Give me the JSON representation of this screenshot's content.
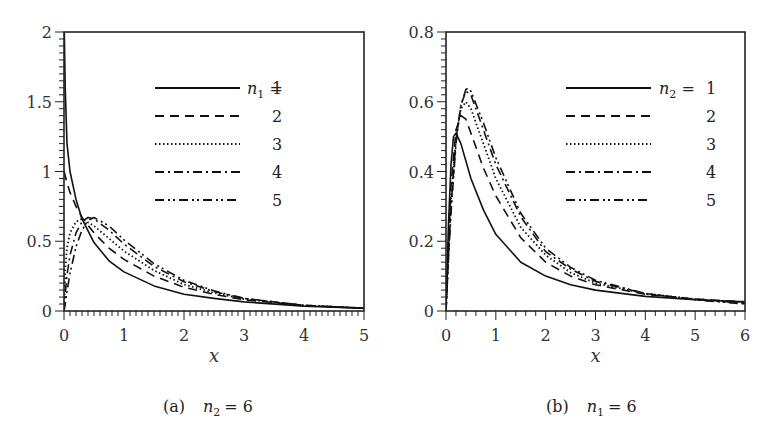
{
  "chart_data": [
    {
      "type": "line",
      "panel": "a",
      "caption": "(a)",
      "caption_param": "n",
      "caption_sub": "2",
      "caption_value": "= 6",
      "xlabel": "x",
      "ylabel": "",
      "xlim": [
        0,
        5
      ],
      "ylim": [
        0,
        2
      ],
      "xticks": [
        "0",
        "1",
        "2",
        "3",
        "4",
        "5"
      ],
      "yticks": [
        "0",
        "0.5",
        "1",
        "1.5",
        "2"
      ],
      "grid": false,
      "legend_position": "upper right",
      "legend_title_var": "n",
      "legend_title_sub": "1",
      "series": [
        {
          "name": "1",
          "style": "solid",
          "x": [
            0.005,
            0.02,
            0.05,
            0.1,
            0.2,
            0.3,
            0.5,
            0.75,
            1.0,
            1.5,
            2.0,
            2.5,
            3.0,
            4.0,
            5.0
          ],
          "y": [
            2.0,
            1.6,
            1.2,
            1.0,
            0.8,
            0.66,
            0.49,
            0.36,
            0.28,
            0.18,
            0.12,
            0.09,
            0.065,
            0.035,
            0.02
          ]
        },
        {
          "name": "2",
          "style": "dashed",
          "x": [
            0.0,
            0.02,
            0.05,
            0.1,
            0.2,
            0.3,
            0.5,
            0.75,
            1.0,
            1.5,
            2.0,
            2.5,
            3.0,
            4.0,
            5.0
          ],
          "y": [
            1.0,
            0.97,
            0.92,
            0.85,
            0.75,
            0.67,
            0.56,
            0.45,
            0.37,
            0.25,
            0.17,
            0.12,
            0.08,
            0.04,
            0.02
          ]
        },
        {
          "name": "3",
          "style": "dotted",
          "x": [
            0.0,
            0.02,
            0.05,
            0.1,
            0.2,
            0.3,
            0.5,
            0.75,
            1.0,
            1.5,
            2.0,
            2.5,
            3.0,
            4.0,
            5.0
          ],
          "y": [
            0.0,
            0.3,
            0.45,
            0.56,
            0.64,
            0.66,
            0.61,
            0.52,
            0.43,
            0.29,
            0.19,
            0.13,
            0.085,
            0.04,
            0.02
          ]
        },
        {
          "name": "4",
          "style": "dashdot",
          "x": [
            0.0,
            0.02,
            0.05,
            0.1,
            0.2,
            0.3,
            0.4,
            0.5,
            0.75,
            1.0,
            1.5,
            2.0,
            2.5,
            3.0,
            4.0,
            5.0
          ],
          "y": [
            0.0,
            0.12,
            0.26,
            0.4,
            0.56,
            0.64,
            0.67,
            0.66,
            0.58,
            0.48,
            0.32,
            0.21,
            0.14,
            0.09,
            0.04,
            0.02
          ]
        },
        {
          "name": "5",
          "style": "dashdotdot",
          "x": [
            0.0,
            0.02,
            0.05,
            0.1,
            0.2,
            0.3,
            0.4,
            0.5,
            0.75,
            1.0,
            1.5,
            2.0,
            2.5,
            3.0,
            4.0,
            5.0
          ],
          "y": [
            0.0,
            0.05,
            0.14,
            0.27,
            0.46,
            0.58,
            0.65,
            0.67,
            0.61,
            0.51,
            0.34,
            0.22,
            0.145,
            0.09,
            0.04,
            0.02
          ]
        }
      ]
    },
    {
      "type": "line",
      "panel": "b",
      "caption": "(b)",
      "caption_param": "n",
      "caption_sub": "1",
      "caption_value": "= 6",
      "xlabel": "x",
      "ylabel": "",
      "xlim": [
        0,
        6
      ],
      "ylim": [
        0,
        0.8
      ],
      "xticks": [
        "0",
        "1",
        "2",
        "3",
        "4",
        "5",
        "6"
      ],
      "yticks": [
        "0",
        "0.2",
        "0.4",
        "0.6",
        "0.8"
      ],
      "grid": false,
      "legend_position": "upper right",
      "legend_title_var": "n",
      "legend_title_sub": "2",
      "series": [
        {
          "name": "1",
          "style": "solid",
          "x": [
            0.0,
            0.05,
            0.1,
            0.15,
            0.2,
            0.3,
            0.5,
            0.75,
            1.0,
            1.5,
            2.0,
            2.5,
            3.0,
            4.0,
            5.0,
            6.0
          ],
          "y": [
            0.0,
            0.25,
            0.42,
            0.5,
            0.51,
            0.48,
            0.38,
            0.29,
            0.22,
            0.14,
            0.1,
            0.075,
            0.06,
            0.042,
            0.032,
            0.026
          ]
        },
        {
          "name": "2",
          "style": "dashed",
          "x": [
            0.0,
            0.05,
            0.1,
            0.2,
            0.3,
            0.4,
            0.5,
            0.75,
            1.0,
            1.5,
            2.0,
            2.5,
            3.0,
            4.0,
            5.0,
            6.0
          ],
          "y": [
            0.0,
            0.2,
            0.36,
            0.52,
            0.56,
            0.55,
            0.51,
            0.41,
            0.33,
            0.21,
            0.14,
            0.1,
            0.075,
            0.048,
            0.034,
            0.026
          ]
        },
        {
          "name": "3",
          "style": "dotted",
          "x": [
            0.0,
            0.05,
            0.1,
            0.2,
            0.3,
            0.4,
            0.5,
            0.75,
            1.0,
            1.5,
            2.0,
            2.5,
            3.0,
            4.0,
            5.0,
            6.0
          ],
          "y": [
            0.0,
            0.18,
            0.32,
            0.5,
            0.58,
            0.6,
            0.58,
            0.48,
            0.38,
            0.24,
            0.16,
            0.11,
            0.08,
            0.05,
            0.034,
            0.025
          ]
        },
        {
          "name": "4",
          "style": "dashdot",
          "x": [
            0.0,
            0.05,
            0.1,
            0.2,
            0.3,
            0.4,
            0.5,
            0.75,
            1.0,
            1.5,
            2.0,
            2.5,
            3.0,
            4.0,
            5.0,
            6.0
          ],
          "y": [
            0.0,
            0.16,
            0.3,
            0.49,
            0.59,
            0.63,
            0.62,
            0.52,
            0.42,
            0.27,
            0.17,
            0.12,
            0.085,
            0.05,
            0.033,
            0.022
          ]
        },
        {
          "name": "5",
          "style": "dashdotdot",
          "x": [
            0.0,
            0.05,
            0.1,
            0.2,
            0.3,
            0.4,
            0.45,
            0.5,
            0.75,
            1.0,
            1.5,
            2.0,
            2.5,
            3.0,
            4.0,
            5.0,
            6.0
          ],
          "y": [
            0.0,
            0.15,
            0.28,
            0.48,
            0.59,
            0.635,
            0.64,
            0.63,
            0.54,
            0.44,
            0.28,
            0.18,
            0.125,
            0.088,
            0.05,
            0.032,
            0.02
          ]
        }
      ]
    }
  ],
  "panels": [
    {
      "xticks": [
        "0",
        "1",
        "2",
        "3",
        "4",
        "5"
      ],
      "yticks": [
        "0",
        "0.5",
        "1",
        "1.5",
        "2"
      ]
    },
    {
      "xticks": [
        "0",
        "1",
        "2",
        "3",
        "4",
        "5",
        "6"
      ],
      "yticks": [
        "0",
        "0.2",
        "0.4",
        "0.6",
        "0.8"
      ]
    }
  ],
  "colors": {
    "line": "#111111",
    "axis": "#222222",
    "text": "#333333",
    "background": "#ffffff"
  }
}
